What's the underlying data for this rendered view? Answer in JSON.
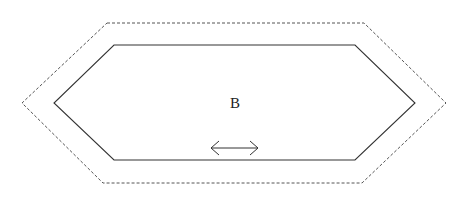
{
  "diagram": {
    "label": "B",
    "colors": {
      "inner_stroke": "#333333",
      "outer_stroke": "#555555",
      "arrow_stroke": "#333333",
      "background": "#ffffff"
    },
    "inner_hexagon": {
      "points": [
        [
          114,
          45
        ],
        [
          355,
          45
        ],
        [
          415,
          103
        ],
        [
          355,
          160
        ],
        [
          114,
          160
        ],
        [
          54,
          103
        ]
      ],
      "style": "solid"
    },
    "outer_hexagon": {
      "points": [
        [
          107,
          23
        ],
        [
          364,
          23
        ],
        [
          446,
          103
        ],
        [
          362,
          183
        ],
        [
          103,
          183
        ],
        [
          22,
          103
        ]
      ],
      "style": "dashed"
    },
    "double_arrow": {
      "x1": 211,
      "x2": 258,
      "y": 148
    },
    "label_position": {
      "x": 235,
      "y": 108
    }
  }
}
